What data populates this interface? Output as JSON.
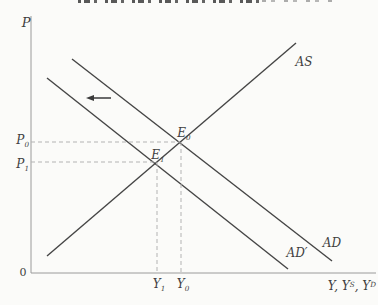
{
  "labels": {
    "y_axis": "P",
    "origin": "0",
    "p0": {
      "base": "P",
      "sub": "0"
    },
    "p1": {
      "base": "P",
      "sub": "1"
    },
    "e0": {
      "base": "E",
      "sub": "0"
    },
    "e1": {
      "base": "E",
      "sub": "1"
    },
    "y1": {
      "base": "Y",
      "sub": "1"
    },
    "y0": {
      "base": "Y",
      "sub": "0"
    },
    "as_curve": "AS",
    "ad_curve": "AD",
    "ad_prime_curve": "AD′",
    "x_axis": {
      "part1": "Y, Y",
      "sup1": "S",
      "part2": ", Y",
      "sup2": "D"
    }
  },
  "colors": {
    "curve": "#454545",
    "axis": "#9a9a9a",
    "dash": "#b3b3b3",
    "arrow": "#3a3a3a",
    "background": "#fbfbf9",
    "text": "#3f3f3f"
  },
  "geometry": {
    "lines": [
      {
        "name": "y-axis",
        "x1": 31,
        "y1": 16,
        "x2": 31,
        "y2": 273,
        "color": "axis",
        "w": 1
      },
      {
        "name": "x-axis",
        "x1": 31,
        "y1": 273,
        "x2": 376,
        "y2": 273,
        "color": "axis",
        "w": 1
      },
      {
        "name": "as-curve",
        "x1": 47,
        "y1": 256,
        "x2": 296,
        "y2": 43,
        "color": "curve",
        "w": 1.4
      },
      {
        "name": "ad-curve",
        "x1": 72,
        "y1": 59,
        "x2": 332,
        "y2": 261,
        "color": "curve",
        "w": 1.4
      },
      {
        "name": "ad-prime-curve",
        "x1": 47,
        "y1": 78,
        "x2": 288,
        "y2": 269,
        "color": "curve",
        "w": 1.4
      },
      {
        "name": "p0-dashed-guide",
        "x1": 31,
        "y1": 142,
        "x2": 180,
        "y2": 142,
        "color": "dash",
        "w": 1,
        "dash": "4 3"
      },
      {
        "name": "p1-dashed-guide",
        "x1": 31,
        "y1": 162,
        "x2": 157,
        "y2": 162,
        "color": "dash",
        "w": 1,
        "dash": "4 3"
      },
      {
        "name": "y0-dashed-guide",
        "x1": 181,
        "y1": 142,
        "x2": 181,
        "y2": 273,
        "color": "dash",
        "w": 1,
        "dash": "4 3"
      },
      {
        "name": "y1-dashed-guide",
        "x1": 157,
        "y1": 162,
        "x2": 157,
        "y2": 273,
        "color": "dash",
        "w": 1,
        "dash": "4 3"
      }
    ],
    "arrow": {
      "name": "ad-shift-arrow",
      "x1": 111,
      "y1": 98,
      "x2": 86,
      "y2": 98,
      "color": "arrow",
      "w": 1.5,
      "head_len": 8,
      "head_half_w": 3
    }
  }
}
